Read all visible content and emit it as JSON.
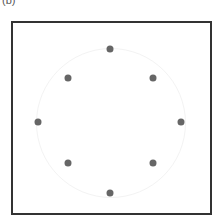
{
  "panel_label": "(b)",
  "dot_color": "#666666",
  "dots": [
    {
      "x": 110,
      "y": 49
    },
    {
      "x": 153,
      "y": 78
    },
    {
      "x": 181,
      "y": 122
    },
    {
      "x": 153,
      "y": 163
    },
    {
      "x": 110,
      "y": 193
    },
    {
      "x": 68,
      "y": 163
    },
    {
      "x": 38,
      "y": 122
    },
    {
      "x": 68,
      "y": 78
    }
  ]
}
